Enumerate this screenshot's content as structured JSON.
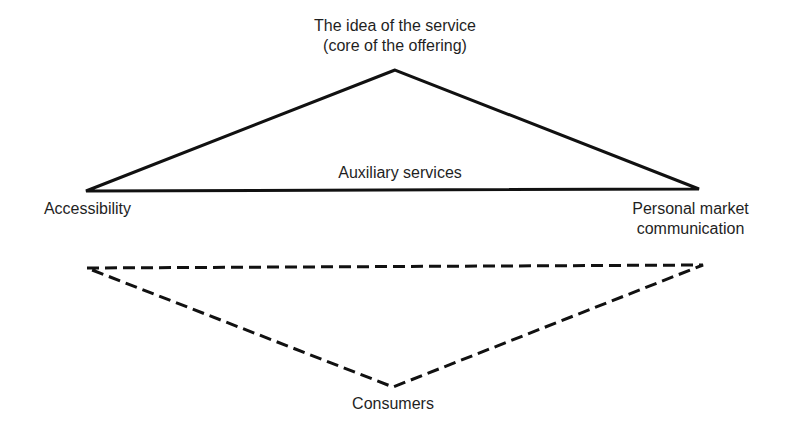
{
  "diagram": {
    "type": "service-offering-triangle",
    "upper_triangle": {
      "style": "solid",
      "stroke_color": "#111111",
      "vertices": {
        "top": {
          "x": 395,
          "y": 70
        },
        "left": {
          "x": 86,
          "y": 191
        },
        "right": {
          "x": 699,
          "y": 189
        }
      }
    },
    "lower_triangle": {
      "style": "dashed",
      "stroke_color": "#111111",
      "vertices": {
        "left": {
          "x": 87,
          "y": 268
        },
        "right": {
          "x": 703,
          "y": 265
        },
        "bottom": {
          "x": 393,
          "y": 387
        }
      }
    },
    "labels": {
      "top_line1": "The idea of the service",
      "top_line2": "(core of the offering)",
      "base": "Auxiliary services",
      "left": "Accessibility",
      "right_line1": "Personal market",
      "right_line2": "communication",
      "bottom": "Consumers"
    }
  }
}
